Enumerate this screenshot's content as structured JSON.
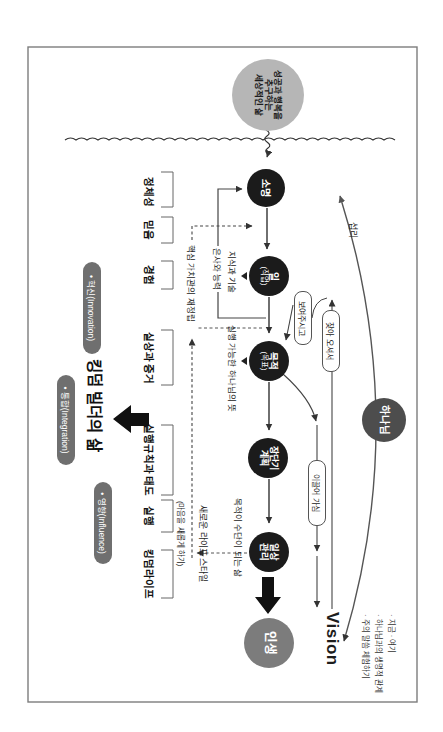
{
  "diagram": {
    "world_circle": {
      "line1": "성공과 행복을",
      "line2": "추구하는",
      "line3": "세상적인 삶"
    },
    "flow": {
      "calling": "소명",
      "work_1": "일",
      "work_2": "(직업)",
      "purpose_1": "목적",
      "purpose_2": "(목표)",
      "plan_1": "장단기",
      "plan_2": "계획",
      "daily_1": "일상",
      "daily_2": "관리",
      "life": "인생",
      "god": "하나님"
    },
    "labels": {
      "identity": "정체성",
      "faith": "믿음",
      "experience": "경험",
      "evidence": "실상과 증거",
      "rules": "실행규칙과 태도",
      "practice": "실행",
      "kingdom_life": "킹덤라이프"
    },
    "annotations": {
      "gifts": "은사와 능력",
      "core_values": "핵심 가치관의 재정립",
      "knowledge": "지식과 기술",
      "gods_will": "실행 가능한 하나님의 뜻",
      "purpose_means": "목적이 수단이 되는 삶",
      "new_lifestyle": "새로운 라이프 스타일",
      "renew_mind": "(마음을 새롭게 하기)",
      "providence": "섭리",
      "vision": "Vision",
      "bullet_1": "· 지금  · 여기",
      "bullet_2": "· 하나님과의 생명적 관계",
      "bullet_3": "· 주의 말씀 체험하기"
    },
    "pills": {
      "show": "보여주시고",
      "come_find": "찾아 오셔서",
      "lead": "이끌어 가심"
    },
    "badges": {
      "innovation": "• 혁신(Innovation)",
      "integration": "• 통합(Integration)",
      "influence": "• 영향(Influence)"
    },
    "kingdom_builder": "킹덤 빌더의 삶",
    "colors": {
      "flow_circle": "#1b1b1b",
      "life_circle": "#7c7c7c",
      "god_circle": "#4d4d4d",
      "world_circle": "#b6b6b6",
      "badge": "#6f6f6f",
      "line": "#333333"
    }
  }
}
